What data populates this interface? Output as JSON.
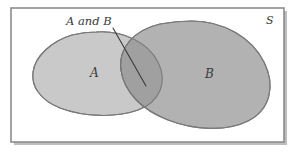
{
  "figure": {
    "kind": "venn-diagram"
  },
  "universe": {
    "label": "S",
    "border_color": "#8c8c8c",
    "fill_color": "#ffffff",
    "shadow_color": "#bdbdbd"
  },
  "sets": {
    "a": {
      "label": "A",
      "fill_color": "#c9c9c9",
      "stroke_color": "#7a7a7a"
    },
    "b": {
      "label": "B",
      "fill_color": "#b2b2b2",
      "stroke_color": "#7a7a7a"
    },
    "intersection": {
      "label": "A and B",
      "fill_color": "#a0a0a0",
      "stroke_color": "#6e6e6e"
    }
  },
  "callout": {
    "text": "A and B",
    "line_color": "#3a3a3a"
  }
}
